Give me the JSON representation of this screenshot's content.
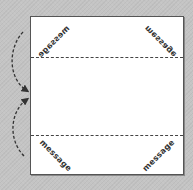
{
  "diagram": {
    "type": "paper-folding-instruction",
    "paper": {
      "shape": "square",
      "fill": "#ffffff",
      "border": "#555555"
    },
    "fold_lines": [
      {
        "name": "top-fold",
        "style": "dashed",
        "y_fraction": 0.26
      },
      {
        "name": "bottom-fold",
        "style": "dashed",
        "y_fraction": 0.76
      }
    ],
    "labels": {
      "top_left": "message",
      "top_right": "message",
      "bottom_left": "message",
      "bottom_right": "message"
    },
    "arrows": [
      {
        "name": "top-flap-fold-arrow",
        "style": "dashed-curved",
        "direction": "down"
      },
      {
        "name": "bottom-flap-fold-arrow",
        "style": "dashed-curved",
        "direction": "up"
      }
    ],
    "colors": {
      "background": "#c4c4c4",
      "line": "#444444",
      "text": "#333333"
    }
  }
}
